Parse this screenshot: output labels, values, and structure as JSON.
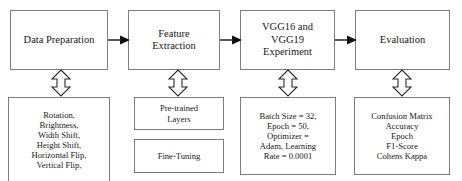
{
  "diagram": {
    "stages": [
      {
        "id": "data-preparation",
        "label": "Data Preparation",
        "detail": "Rotation,\nBrightness,\nWidth Shift,\nHeight Shift,\nHorizontal Flip,\nVertical Flip,"
      },
      {
        "id": "feature-extraction",
        "label": "Feature\nExtraction",
        "detail_primary": "Pre-trained\nLayers",
        "detail_secondary": "Fine-Tuning"
      },
      {
        "id": "vgg-experiment",
        "label": "VGG16 and\nVGG19\nExperiment",
        "detail": "Batch Size = 32,\nEpoch = 50,\nOptimizer =\nAdam, Learning\nRate = 0.0001"
      },
      {
        "id": "evaluation",
        "label": "Evaluation",
        "detail": "Confusion Matrix\nAccuracy\nEpoch\nF1-Score\nCohens Kappa"
      }
    ],
    "connectors": {
      "flow_arrow": "right-arrow-icon",
      "link_arrow": "double-headed-vertical-arrow-icon"
    },
    "colors": {
      "stroke": "#7d7d7d",
      "arrow": "#111111",
      "background": "#ffffff",
      "text": "#171717"
    }
  }
}
